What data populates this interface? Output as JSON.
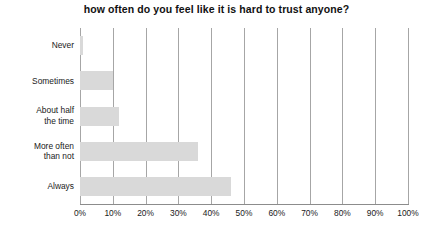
{
  "chart_data": {
    "type": "bar",
    "orientation": "horizontal",
    "title": "how often do you feel like it is hard to trust anyone?",
    "xlabel": "",
    "ylabel": "",
    "categories": [
      "Never",
      "Sometimes",
      "About half\nthe time",
      "More often\nthan not",
      "Always"
    ],
    "values": [
      1,
      10,
      12,
      36,
      46
    ],
    "xlim": [
      0,
      100
    ],
    "xticks": [
      0,
      10,
      20,
      30,
      40,
      50,
      60,
      70,
      80,
      90,
      100
    ],
    "xticklabels": [
      "0%",
      "10%",
      "20%",
      "30%",
      "40%",
      "50%",
      "60%",
      "70%",
      "80%",
      "90%",
      "100%"
    ],
    "grid": "vertical",
    "legend": "none",
    "bar_color": "#d9d9d9",
    "grid_color": "#a6a6a6",
    "axis_color": "#8c8c8c",
    "text_color": "#1a1a1a"
  }
}
